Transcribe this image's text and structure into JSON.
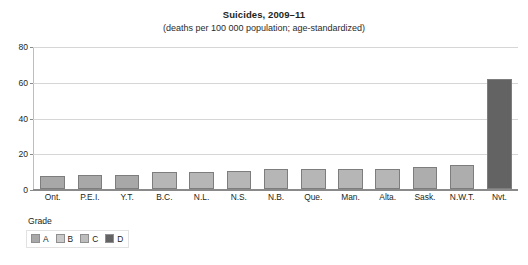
{
  "chart_data": {
    "type": "bar",
    "title": "Suicides, 2009–11",
    "subtitle": "(deaths per 100 000 population; age-standardized)",
    "xlabel": "",
    "ylabel": "",
    "ylim": [
      0,
      80
    ],
    "yticks": [
      0,
      20,
      40,
      60,
      80
    ],
    "grid": true,
    "legend_position": "bottom-left",
    "categories": [
      "Ont.",
      "P.E.I.",
      "Y.T.",
      "B.C.",
      "N.L.",
      "N.S.",
      "N.B.",
      "Que.",
      "Man.",
      "Alta.",
      "Sask.",
      "N.W.T.",
      "Nvt."
    ],
    "values": [
      7.5,
      8.0,
      8.0,
      9.5,
      9.7,
      10.0,
      11.0,
      11.3,
      11.5,
      11.4,
      12.5,
      13.5,
      62.0
    ],
    "grades": [
      "A",
      "A",
      "A",
      "B",
      "B",
      "B",
      "B",
      "B",
      "B",
      "B",
      "C",
      "C",
      "D"
    ],
    "bar_colors": [
      "#a8a8a8",
      "#a8a8a8",
      "#a8a8a8",
      "#b6b6b6",
      "#b6b6b6",
      "#b6b6b6",
      "#b6b6b6",
      "#b6b6b6",
      "#b6b6b6",
      "#b6b6b6",
      "#adadad",
      "#adadad",
      "#636363"
    ],
    "legend": {
      "title": "Grade",
      "entries": [
        {
          "label": "A",
          "color": "#a8a8a8"
        },
        {
          "label": "B",
          "color": "#c9c9c9"
        },
        {
          "label": "C",
          "color": "#bdbdbd"
        },
        {
          "label": "D",
          "color": "#636363"
        }
      ]
    },
    "colors": {
      "gridline": "#d6d6d6",
      "axis": "#8a8a8a",
      "text": "#231f20",
      "background": "#ffffff"
    }
  }
}
